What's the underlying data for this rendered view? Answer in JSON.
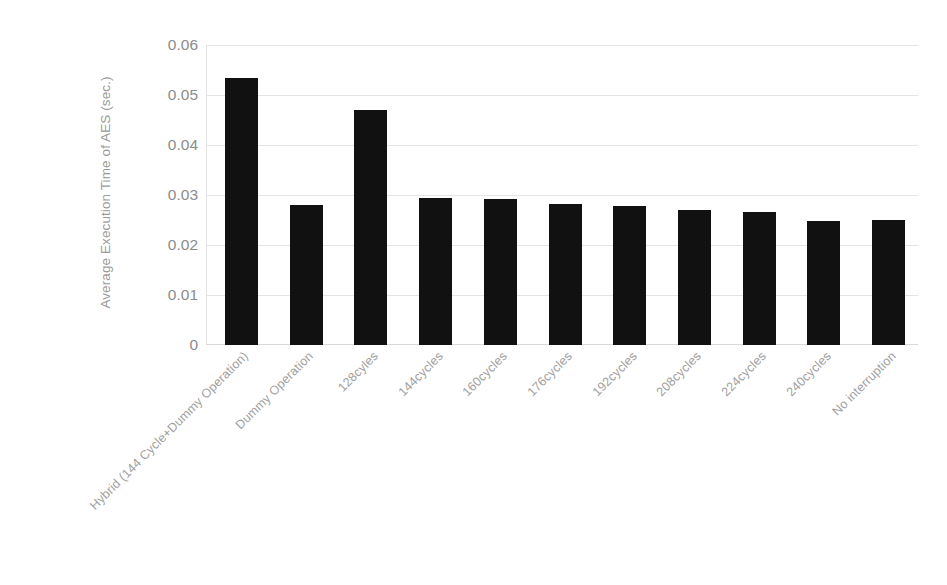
{
  "chart_data": {
    "type": "bar",
    "title": "",
    "xlabel": "",
    "ylabel": "Average Execution Time of AES (sec.)",
    "ylim": [
      0,
      0.06
    ],
    "ytick_labels": [
      "0.06",
      "0.05",
      "0.04",
      "0.03",
      "0.02",
      "0.01",
      "0"
    ],
    "ytick_values": [
      0.06,
      0.05,
      0.04,
      0.03,
      0.02,
      0.01,
      0
    ],
    "grid": true,
    "legend": null,
    "bar_color": "#111111",
    "categories": [
      "Hybrid (144 Cycle+Dummy Operation)",
      "Dummy Operation",
      "128cyles",
      "144cycles",
      "160cycles",
      "176cycles",
      "192cycles",
      "208cycles",
      "224cycles",
      "240cycles",
      "No interruption"
    ],
    "values": [
      0.0534,
      0.028,
      0.047,
      0.0294,
      0.0293,
      0.0283,
      0.0278,
      0.0271,
      0.0267,
      0.0248,
      0.025
    ]
  },
  "colors": {
    "bar": "#111111",
    "gridline": "#e4e4e4",
    "tick_text": "#8c8c8c",
    "axis_title_text": "#9a9a9a",
    "category_text": "#a0a0a0",
    "background": "#ffffff"
  }
}
